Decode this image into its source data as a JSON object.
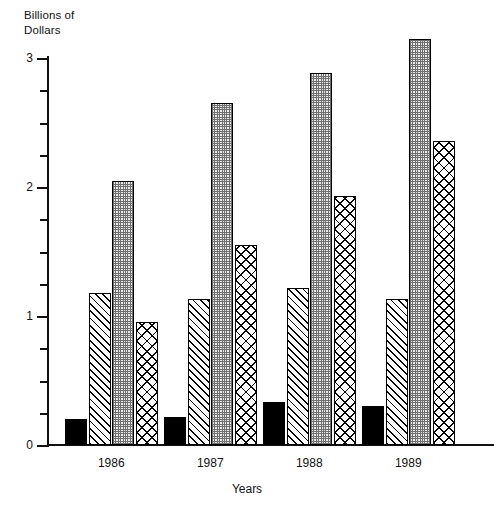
{
  "chart_data": {
    "type": "bar",
    "title": "",
    "subtitle": "",
    "ylabel": "Billions of\nDollars",
    "xlabel": "Years",
    "categories": [
      "1986",
      "1987",
      "1988",
      "1989"
    ],
    "ylim": [
      0,
      3
    ],
    "yticks": [
      "0",
      "1",
      "2",
      "3"
    ],
    "ytick_values": [
      0,
      1,
      2,
      3
    ],
    "yminor_step": 0.25,
    "grid": false,
    "legend": "none",
    "series": [
      {
        "name": "series-1",
        "pattern": "solid-black",
        "color": "#000000",
        "values": [
          0.2,
          0.22,
          0.33,
          0.3
        ]
      },
      {
        "name": "series-2",
        "pattern": "diagonal-hatch",
        "color": "#000000",
        "values": [
          1.18,
          1.13,
          1.22,
          1.13
        ]
      },
      {
        "name": "series-3",
        "pattern": "stipple-gray",
        "color": "#cccccc",
        "values": [
          2.05,
          2.65,
          2.88,
          3.15
        ]
      },
      {
        "name": "series-4",
        "pattern": "cross-hatch",
        "color": "#000000",
        "values": [
          0.95,
          1.55,
          1.93,
          2.36
        ]
      }
    ]
  }
}
